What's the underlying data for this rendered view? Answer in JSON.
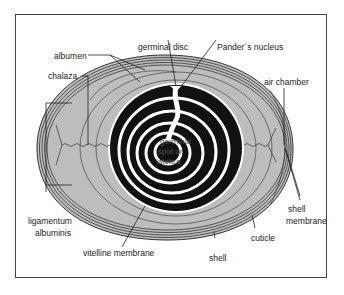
{
  "diagram": {
    "labels": {
      "albumen": "albumen",
      "chalaza": "chalaza",
      "germinal_disc": "germinal disc",
      "panders_nucleus": "Pander´s nucleus",
      "air_chamber": "air chamber",
      "shell_membrane_line1": "shell",
      "shell_membrane_line2": "membrane",
      "ligamentum_line1": "ligamentum",
      "ligamentum_line2": "albuminis",
      "vitelline_membrane": "vitelline membrane",
      "cuticle": "cuticle",
      "shell": "shell",
      "center_line1": "germinal",
      "center_line2": "spot or",
      "center_line3": "latebra"
    },
    "colors": {
      "albumen_fill": "#bdbdbd",
      "yolk_dark": "#111111",
      "yolk_light": "#ffffff",
      "line": "#333333",
      "frame": "#444444"
    }
  }
}
